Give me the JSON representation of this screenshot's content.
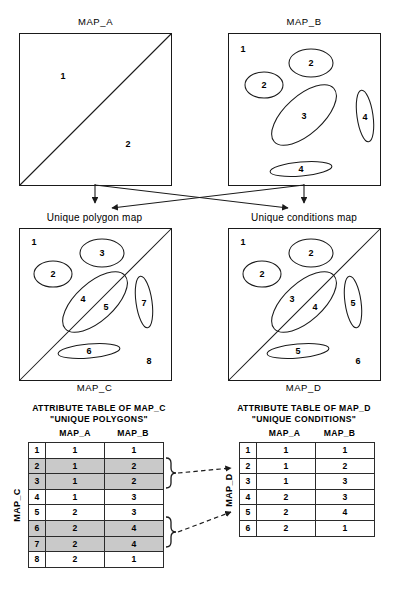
{
  "figure": {
    "maps": [
      {
        "id": "map_a",
        "title": "MAP_A",
        "title_pos": "top",
        "labels": [
          "1",
          "2"
        ]
      },
      {
        "id": "map_b",
        "title": "MAP_B",
        "title_pos": "top",
        "labels": [
          "1",
          "2",
          "2",
          "3",
          "4",
          "4"
        ]
      },
      {
        "id": "map_c",
        "title": "Unique polygon map",
        "caption": "MAP_C",
        "title_pos": "top",
        "labels": [
          "1",
          "2",
          "3",
          "4",
          "5",
          "6",
          "7",
          "8"
        ]
      },
      {
        "id": "map_d",
        "title": "Unique conditions map",
        "caption": "MAP_D",
        "title_pos": "top",
        "labels": [
          "1",
          "2",
          "2",
          "3",
          "4",
          "5",
          "5",
          "6"
        ]
      }
    ],
    "map_a_labels": {
      "region1": "1",
      "region2": "2"
    },
    "map_b_labels": {
      "background": "1",
      "ellipse_top": "2",
      "ellipse_left": "2",
      "ellipse_big": "3",
      "ellipse_right": "4",
      "ellipse_bottom": "4"
    },
    "map_c_labels": {
      "background": "1",
      "ellipse_left": "2",
      "ellipse_top": "3",
      "ellipse_big_left": "4",
      "ellipse_big_right": "5",
      "ellipse_bottom": "6",
      "ellipse_right": "7",
      "background_lower": "8"
    },
    "map_d_labels": {
      "background": "1",
      "ellipse_top": "2",
      "ellipse_left": "2",
      "ellipse_big_left": "3",
      "ellipse_big_right": "4",
      "ellipse_right": "5",
      "ellipse_bottom": "5",
      "background_lower": "6"
    }
  },
  "tables": {
    "left": {
      "title_line1": "ATTRIBUTE TABLE OF MAP_C",
      "title_line2": "\"UNIQUE POLYGONS\"",
      "side_label": "MAP_C",
      "columns": [
        "MAP_A",
        "MAP_B"
      ],
      "rows": [
        {
          "id": "1",
          "map_a": "1",
          "map_b": "1",
          "shaded": false
        },
        {
          "id": "2",
          "map_a": "1",
          "map_b": "2",
          "shaded": true
        },
        {
          "id": "3",
          "map_a": "1",
          "map_b": "2",
          "shaded": true
        },
        {
          "id": "4",
          "map_a": "1",
          "map_b": "3",
          "shaded": false
        },
        {
          "id": "5",
          "map_a": "2",
          "map_b": "3",
          "shaded": false
        },
        {
          "id": "6",
          "map_a": "2",
          "map_b": "4",
          "shaded": true
        },
        {
          "id": "7",
          "map_a": "2",
          "map_b": "4",
          "shaded": true
        },
        {
          "id": "8",
          "map_a": "2",
          "map_b": "1",
          "shaded": false
        }
      ]
    },
    "right": {
      "title_line1": "ATTRIBUTE TABLE OF MAP_D",
      "title_line2": "\"UNIQUE CONDITIONS\"",
      "side_label": "MAP_D",
      "columns": [
        "MAP_A",
        "MAP_B"
      ],
      "rows": [
        {
          "id": "1",
          "map_a": "1",
          "map_b": "1",
          "shaded": false
        },
        {
          "id": "2",
          "map_a": "1",
          "map_b": "2",
          "shaded": false
        },
        {
          "id": "3",
          "map_a": "1",
          "map_b": "3",
          "shaded": false
        },
        {
          "id": "4",
          "map_a": "2",
          "map_b": "3",
          "shaded": false
        },
        {
          "id": "5",
          "map_a": "2",
          "map_b": "4",
          "shaded": false
        },
        {
          "id": "6",
          "map_a": "2",
          "map_b": "1",
          "shaded": false
        }
      ]
    }
  },
  "colors": {
    "line": "#1a1a1a",
    "shade": "#c9c9c9",
    "background": "#ffffff"
  }
}
